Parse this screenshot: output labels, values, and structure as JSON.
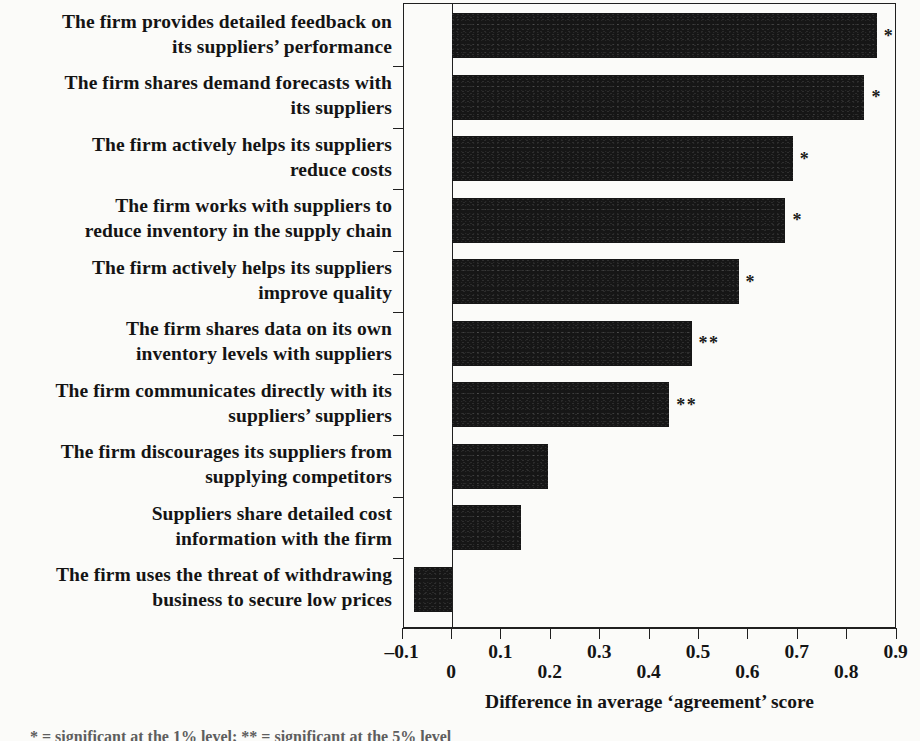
{
  "chart_data": {
    "type": "bar",
    "orientation": "horizontal",
    "title": "",
    "xlabel": "Difference in average ‘agreement’ score",
    "ylabel": "",
    "xlim": [
      -0.12,
      0.9
    ],
    "xticks": [
      -0.1,
      0,
      0.1,
      0.2,
      0.3,
      0.4,
      0.5,
      0.6,
      0.7,
      0.8,
      0.9
    ],
    "xticklabels": [
      "–0.1",
      "0",
      "0.1",
      "0.2",
      "0.3",
      "0.4",
      "0.5",
      "0.6",
      "0.7",
      "0.8",
      "0.9"
    ],
    "xticklabel_rows": [
      0,
      1,
      0,
      1,
      0,
      1,
      0,
      1,
      0,
      1,
      0
    ],
    "grid": false,
    "legend": "none",
    "bar_color": "#161616",
    "categories": [
      "The firm provides detailed feedback on\nits suppliers’ performance",
      "The firm shares demand forecasts with\nits suppliers",
      "The firm actively helps its suppliers\nreduce costs",
      "The firm works with suppliers to\nreduce inventory in the supply chain",
      "The firm actively helps its suppliers\nimprove quality",
      "The firm shares data on its own\ninventory levels with suppliers",
      "The firm communicates directly with its\nsuppliers’ suppliers",
      "The firm discourages its suppliers from\nsupplying competitors",
      "Suppliers share detailed cost\ninformation with the firm",
      "The firm uses the threat of withdrawing\nbusiness to secure low prices"
    ],
    "values": [
      0.86,
      0.835,
      0.69,
      0.675,
      0.58,
      0.485,
      0.44,
      0.195,
      0.14,
      -0.077
    ],
    "annotations": [
      "*",
      "*",
      "*",
      "*",
      "*",
      "**",
      "**",
      "",
      "",
      ""
    ]
  },
  "footnote": {
    "text": "* = significant at the 1% level;   ** = significant at the 5% level"
  }
}
